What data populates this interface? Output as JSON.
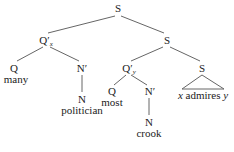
{
  "tree": {
    "root": {
      "label": "S"
    },
    "qx": {
      "label": "Q′",
      "subscript": "x"
    },
    "s1": {
      "label": "S"
    },
    "q1": {
      "label": "Q",
      "word": "many"
    },
    "n1bar": {
      "label": "N′"
    },
    "n1": {
      "label": "N",
      "word": "politician"
    },
    "qy": {
      "label": "Q′",
      "subscript": "y"
    },
    "q2": {
      "label": "Q",
      "word": "most"
    },
    "n2bar": {
      "label": "N′"
    },
    "n2": {
      "label": "N",
      "word": "crook"
    },
    "s2": {
      "label": "S",
      "triangle_x": "x",
      "triangle_verb": "admires",
      "triangle_y": "y"
    }
  },
  "colors": {
    "line": "#666666",
    "text": "#222222"
  }
}
